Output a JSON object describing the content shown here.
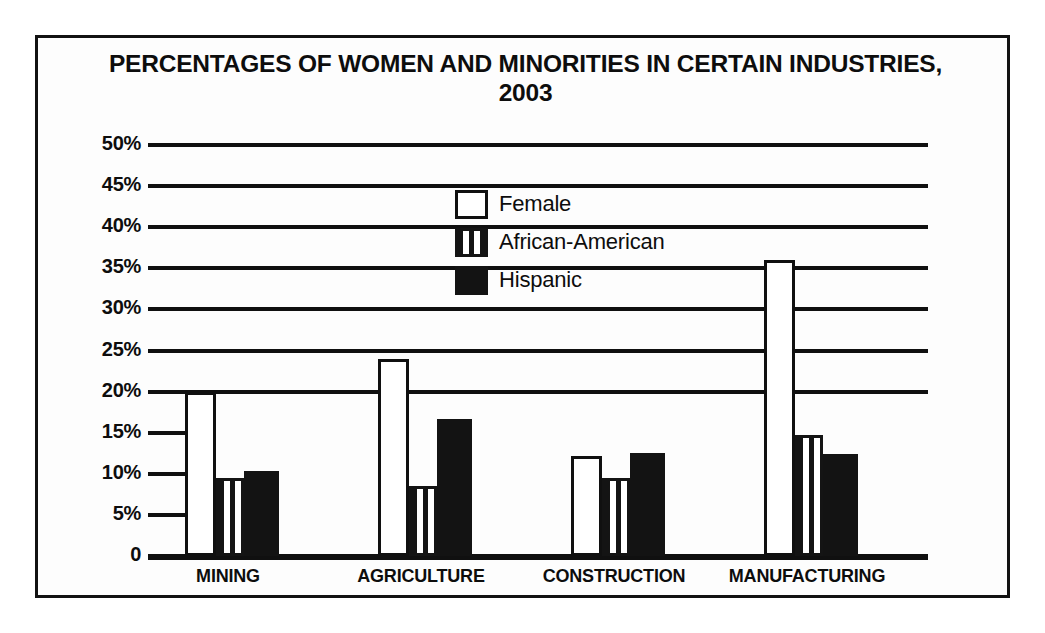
{
  "chart_data": {
    "type": "bar",
    "title": "PERCENTAGES OF WOMEN AND MINORITIES IN CERTAIN INDUSTRIES, 2003",
    "title_line1": "PERCENTAGES OF WOMEN AND MINORITIES IN CERTAIN INDUSTRIES,",
    "title_line2": "2003",
    "xlabel": "",
    "ylabel": "",
    "ylim": [
      0,
      50
    ],
    "ytick_labels": [
      "50%",
      "45%",
      "40%",
      "35%",
      "30%",
      "25%",
      "20%",
      "15%",
      "10%",
      "5%",
      "0"
    ],
    "ytick_values": [
      50,
      45,
      40,
      35,
      30,
      25,
      20,
      15,
      10,
      5,
      0
    ],
    "grid": true,
    "legend_position": "upper-center",
    "categories": [
      "MINING",
      "AGRICULTURE",
      "CONSTRUCTION",
      "MANUFACTURING"
    ],
    "series": [
      {
        "name": "Female",
        "pattern": "white-outline",
        "color": "#ffffff",
        "values": [
          20.0,
          24.0,
          12.2,
          36.0
        ]
      },
      {
        "name": "African-American",
        "pattern": "vertical-stripes",
        "color": "#141414",
        "values": [
          9.5,
          8.5,
          9.5,
          14.7
        ]
      },
      {
        "name": "Hispanic",
        "pattern": "solid-black",
        "color": "#131313",
        "values": [
          10.3,
          16.7,
          12.5,
          12.4
        ]
      }
    ]
  },
  "legend": {
    "items": [
      {
        "label": "Female"
      },
      {
        "label": "African-American"
      },
      {
        "label": "Hispanic"
      }
    ]
  }
}
